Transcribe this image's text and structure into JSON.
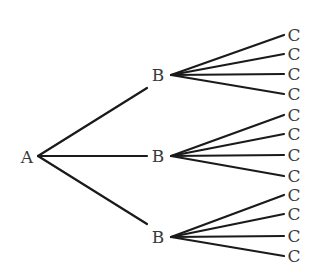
{
  "diagram": {
    "type": "tree",
    "root": {
      "label": "A",
      "x": 27,
      "y": 157,
      "jx": 38,
      "jy": 156
    },
    "children": [
      {
        "label": "B",
        "x": 158,
        "y": 75,
        "jx": 171,
        "jy": 75,
        "ex": 147,
        "ey": 88,
        "leaves": [
          {
            "label": "C",
            "y": 35
          },
          {
            "label": "C",
            "y": 54
          },
          {
            "label": "C",
            "y": 74
          },
          {
            "label": "C",
            "y": 94
          }
        ]
      },
      {
        "label": "B",
        "x": 158,
        "y": 156,
        "jx": 171,
        "jy": 156,
        "ex": 147,
        "ey": 156,
        "leaves": [
          {
            "label": "C",
            "y": 115
          },
          {
            "label": "C",
            "y": 134
          },
          {
            "label": "C",
            "y": 155
          },
          {
            "label": "C",
            "y": 176
          }
        ]
      },
      {
        "label": "B",
        "x": 158,
        "y": 237,
        "jx": 171,
        "jy": 237,
        "ex": 147,
        "ey": 224,
        "leaves": [
          {
            "label": "C",
            "y": 195
          },
          {
            "label": "C",
            "y": 214
          },
          {
            "label": "C",
            "y": 236
          },
          {
            "label": "C",
            "y": 256
          }
        ]
      }
    ],
    "leaf_line_x": 284,
    "leaf_label_x": 294
  }
}
